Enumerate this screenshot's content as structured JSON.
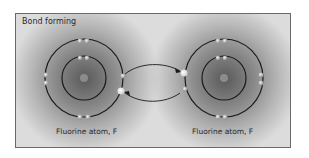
{
  "diagram": {
    "title": "Bond forming",
    "atoms": [
      {
        "label": "Fluorine atom, F",
        "nucleus": "9+"
      },
      {
        "label": "Fluorine atom, F",
        "nucleus": "9+"
      }
    ],
    "colors": {
      "orbit": "#1a1a1a",
      "electron": "#c8c8c8",
      "bond_electron": "#ffffff",
      "frame": "#6a6a6a"
    }
  }
}
